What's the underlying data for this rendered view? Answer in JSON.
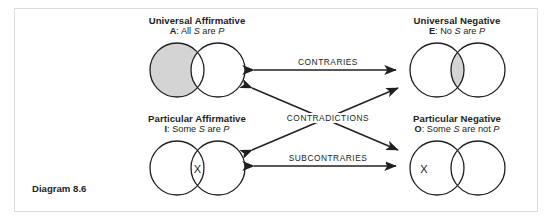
{
  "figure": {
    "caption": "Diagram 8.6",
    "border_color": "#dcdcdc",
    "background": "#ffffff",
    "stroke_color": "#231f20",
    "shade_color": "#d4d4d4"
  },
  "quadrants": [
    {
      "key": "A",
      "title": "Universal Affirmative",
      "letter": "A",
      "separator": ": ",
      "proposition_parts": [
        {
          "text": "All ",
          "style": "normal"
        },
        {
          "text": "S",
          "style": "italic"
        },
        {
          "text": " are ",
          "style": "normal"
        },
        {
          "text": "P",
          "style": "italic"
        }
      ],
      "proposition": "All S are P",
      "venn": {
        "shaded_region": "left-only",
        "x_region": "none"
      }
    },
    {
      "key": "E",
      "title": "Universal Negative",
      "letter": "E",
      "separator": ": ",
      "proposition_parts": [
        {
          "text": "No ",
          "style": "normal"
        },
        {
          "text": "S",
          "style": "italic"
        },
        {
          "text": " are ",
          "style": "normal"
        },
        {
          "text": "P",
          "style": "italic"
        }
      ],
      "proposition": "No S are P",
      "venn": {
        "shaded_region": "overlap",
        "x_region": "none"
      }
    },
    {
      "key": "I",
      "title": "Particular Affirmative",
      "letter": "I",
      "separator": ": ",
      "proposition_parts": [
        {
          "text": "Some ",
          "style": "normal"
        },
        {
          "text": "S",
          "style": "italic"
        },
        {
          "text": " are ",
          "style": "normal"
        },
        {
          "text": "P",
          "style": "italic"
        }
      ],
      "proposition": "Some S are P",
      "venn": {
        "shaded_region": "none",
        "x_region": "overlap",
        "x_mark": "X"
      }
    },
    {
      "key": "O",
      "title": "Particular Negative",
      "letter": "O",
      "separator": ": ",
      "proposition_parts": [
        {
          "text": "Some ",
          "style": "normal"
        },
        {
          "text": "S",
          "style": "italic"
        },
        {
          "text": " are not ",
          "style": "normal"
        },
        {
          "text": "P",
          "style": "italic"
        }
      ],
      "proposition": "Some S are not P",
      "venn": {
        "shaded_region": "none",
        "x_region": "left-only",
        "x_mark": "X"
      }
    }
  ],
  "relations": [
    {
      "key": "contraries",
      "label": "CONTRARIES",
      "between": [
        "A",
        "E"
      ],
      "arrow": "double"
    },
    {
      "key": "contradictions",
      "label": "CONTRADICTIONS",
      "between": [
        "A",
        "O",
        "E",
        "I"
      ],
      "arrow": "double"
    },
    {
      "key": "subcontraries",
      "label": "SUBCONTRARIES",
      "between": [
        "I",
        "O"
      ],
      "arrow": "double"
    }
  ]
}
